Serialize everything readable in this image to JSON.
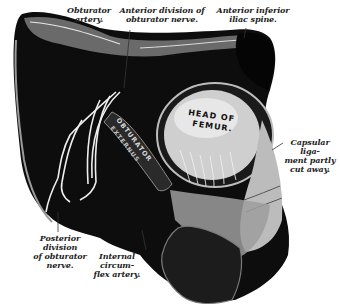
{
  "figure": {
    "background_color": "#ffffff",
    "ink_color": "#111111"
  },
  "labels": {
    "obturator_artery": "Obturator\nartery.",
    "anterior_division": "Anterior division of\nobturator nerve.",
    "anterior_inferior_iliac_spine": "Anterior inferior\niliac spine.",
    "capsular_ligament": "Capsular liga-\nment partly\ncut away.",
    "posterior_division": "Posterior division\nof obturator\nnerve.",
    "internal_circumflex": "Internal circum-\nflex artery."
  },
  "engraved_text": {
    "head_of_femur_line1": "HEAD OF",
    "head_of_femur_line2": "FEMUR.",
    "muscle_line1": "OBTURATOR",
    "muscle_line2": "EXTERNUS"
  }
}
